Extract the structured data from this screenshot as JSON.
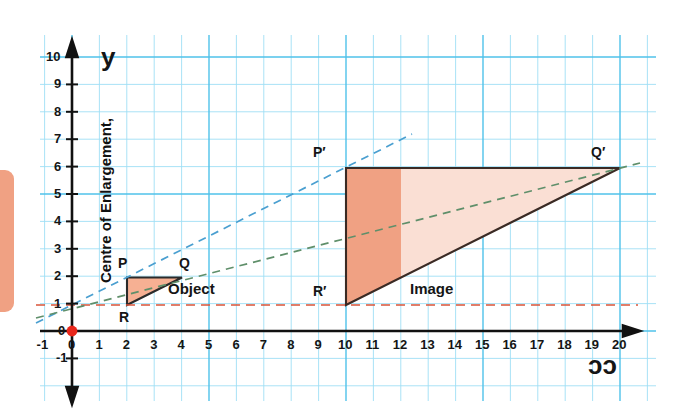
{
  "figure": {
    "topic": "enlargement-transformation-graph",
    "axis_labels": {
      "x": "ɔɔ",
      "y": "y"
    },
    "centre_of_enlargement_label": "Centre of Enlargement,",
    "object_label": "Object",
    "image_label": "Image",
    "centre_point": {
      "x": 0,
      "y": 0
    },
    "scale_factor_implied": 5
  },
  "colors": {
    "grid_minor": "#8fd9f2",
    "grid_major": "#5cc6ec",
    "axis": "#111111",
    "object_fill": "#f6b093",
    "object_stroke": "#2b2b2b",
    "image_fill_dark": "#f0a183",
    "image_fill_light": "#fadfd4",
    "image_stroke": "#3a2a24",
    "ray_upper": "#4a9fd0",
    "ray_lower": "#5f8f6a",
    "guide_red": "#d9543a",
    "centre_dot": "#e8261a",
    "swatch": "#f0a183"
  },
  "chart_data": {
    "type": "scatter",
    "title": "",
    "xlabel": "ɔɔ",
    "ylabel": "y",
    "xlim": [
      -1,
      20
    ],
    "ylim": [
      -1,
      10
    ],
    "grid": true,
    "legend": "none",
    "x_ticks": [
      "-1",
      "0",
      "1",
      "2",
      "3",
      "4",
      "5",
      "6",
      "7",
      "8",
      "9",
      "10",
      "11",
      "12",
      "13",
      "14",
      "15",
      "16",
      "17",
      "18",
      "19",
      "20"
    ],
    "y_ticks": [
      "-1",
      "0",
      "1",
      "2",
      "3",
      "4",
      "5",
      "6",
      "7",
      "8",
      "9",
      "10"
    ],
    "shapes": [
      {
        "name": "Object",
        "vertices": [
          {
            "label": "P",
            "x": 2,
            "y": 2
          },
          {
            "label": "Q",
            "x": 4,
            "y": 2
          },
          {
            "label": "R",
            "x": 2,
            "y": 1
          }
        ]
      },
      {
        "name": "Image",
        "vertices": [
          {
            "label": "P′",
            "x": 10,
            "y": 6
          },
          {
            "label": "Q′",
            "x": 20,
            "y": 6
          },
          {
            "label": "R′",
            "x": 10,
            "y": 1
          }
        ]
      }
    ],
    "rays": [
      {
        "name": "ray-through-P",
        "from": [
          -1.3,
          0.3
        ],
        "to": [
          14.2,
          7.6
        ],
        "color": "#4a9fd0"
      },
      {
        "name": "ray-through-Q",
        "from": [
          -1.3,
          0.55
        ],
        "to": [
          21.2,
          6.3
        ],
        "color": "#5f8f6a"
      }
    ],
    "guides": [
      {
        "name": "baseline-y-1",
        "y": 1,
        "from_x": -1.3,
        "to_x": 20.6,
        "color": "#d9543a"
      }
    ],
    "centre_dot": {
      "x": 0,
      "y": 0,
      "color": "#e8261a"
    },
    "highlight_band": {
      "from_x": 10,
      "to_x": 12,
      "note": "darker shaded strip of Image"
    }
  },
  "ticks": {
    "x": [
      "-1",
      "0",
      "1",
      "2",
      "3",
      "4",
      "5",
      "6",
      "7",
      "8",
      "9",
      "10",
      "11",
      "12",
      "13",
      "14",
      "15",
      "16",
      "17",
      "18",
      "19",
      "20"
    ],
    "y": [
      "10",
      "9",
      "8",
      "7",
      "6",
      "5",
      "4",
      "3",
      "2",
      "1",
      "0",
      "-1"
    ]
  },
  "vertex_labels": {
    "P": "P",
    "Q": "Q",
    "R": "R",
    "Pp": "P′",
    "Qp": "Q′",
    "Rp": "R′"
  }
}
